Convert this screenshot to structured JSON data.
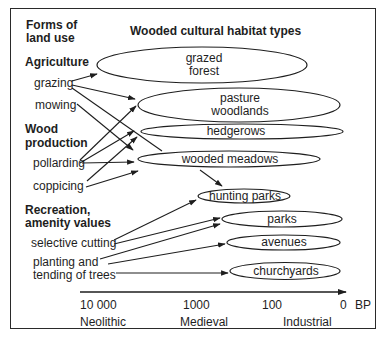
{
  "left_column": {
    "heading": [
      "Forms of",
      "land use"
    ],
    "groups": [
      {
        "title": [
          "Agriculture"
        ],
        "items": [
          [
            "grazing"
          ],
          [
            "mowing"
          ]
        ]
      },
      {
        "title": [
          "Wood",
          "production"
        ],
        "items": [
          [
            "pollarding"
          ],
          [
            "coppicing"
          ]
        ]
      },
      {
        "title": [
          "Recreation,",
          "amenity values"
        ],
        "items": [
          [
            "selective cutting"
          ],
          [
            "planting and",
            "tending of trees"
          ]
        ]
      }
    ]
  },
  "right_column": {
    "heading": "Wooded cultural habitat types",
    "habitats": [
      {
        "lines": [
          "grazed",
          "forest"
        ]
      },
      {
        "lines": [
          "pasture",
          "woodlands"
        ]
      },
      {
        "lines": [
          "hedgerows"
        ]
      },
      {
        "lines": [
          "wooded meadows"
        ]
      },
      {
        "lines": [
          "hunting parks"
        ]
      },
      {
        "lines": [
          "parks"
        ]
      },
      {
        "lines": [
          "avenues"
        ]
      },
      {
        "lines": [
          "churchyards"
        ]
      }
    ]
  },
  "timeline": {
    "ticks": [
      "10 000",
      "1000",
      "100",
      "0"
    ],
    "unit": "BP",
    "periods": [
      "Neolithic",
      "Medieval",
      "Industrial"
    ]
  },
  "colors": {
    "ink": "#1e1e1e",
    "background": "#ffffff"
  }
}
